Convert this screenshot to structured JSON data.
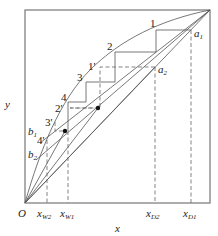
{
  "diagram": {
    "type": "McCabe-Thiele x-y distillation diagram",
    "axes": {
      "x_label": "x",
      "y_label": "y",
      "origin_label": "O"
    },
    "x_ticks": [
      {
        "main": "x",
        "sub": "W2"
      },
      {
        "main": "x",
        "sub": "W1"
      },
      {
        "main": "x",
        "sub": "D2"
      },
      {
        "main": "x",
        "sub": "D1"
      }
    ],
    "points": {
      "a1": {
        "main": "a",
        "sub": "1"
      },
      "a2": {
        "main": "a",
        "sub": "2"
      },
      "b1": {
        "main": "b",
        "sub": "1"
      },
      "b2": {
        "main": "b",
        "sub": "2"
      }
    },
    "stage_labels": {
      "s1": "1",
      "s2": "2",
      "s3": "3",
      "s4": "4",
      "s1p": "1'",
      "s2p": "2'",
      "s3p": "3'",
      "s4p": "4'"
    },
    "colors": {
      "line": "#555555",
      "frame": "#777777",
      "text": "#222222"
    }
  }
}
